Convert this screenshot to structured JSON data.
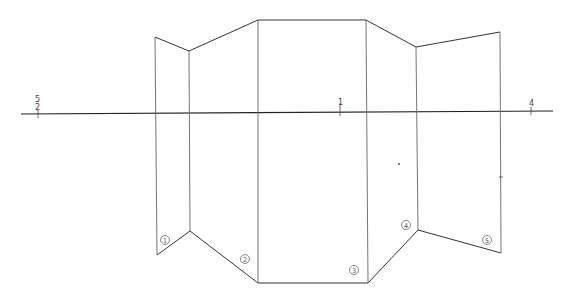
{
  "diagram": {
    "type": "folded-screen-projection",
    "axis_labels": {
      "left_top": "5",
      "left_bottom": "2",
      "center": "1",
      "right": "4"
    },
    "panel_labels": [
      "①",
      "②",
      "③",
      "④",
      "⑤"
    ],
    "colors": {
      "line": "#333333",
      "background": "#ffffff"
    }
  }
}
